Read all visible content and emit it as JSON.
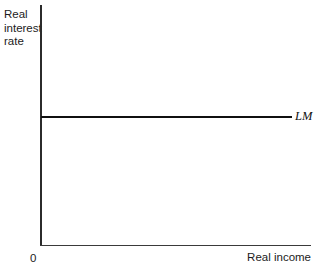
{
  "chart_data": {
    "type": "line",
    "title": "",
    "xlabel": "Real income",
    "ylabel": "Real interest rate",
    "origin_label": "0",
    "axis_ranges": {
      "x": [
        0,
        1
      ],
      "y": [
        0,
        1
      ]
    },
    "grid": false,
    "legend_position": "inline-right-of-curve",
    "series": [
      {
        "name": "LM",
        "description": "Perfectly horizontal LM curve: the real interest rate is constant at all levels of real income",
        "x": [
          0.0,
          0.93
        ],
        "y": [
          0.535,
          0.535
        ]
      }
    ]
  },
  "labels": {
    "ylabel": "Real interest rate",
    "xlabel": "Real income",
    "origin": "0",
    "lm": "LM"
  },
  "colors": {
    "background": "#ffffff",
    "axis": "#2b2b2b",
    "curve": "#101010",
    "text": "#1c1c1c"
  }
}
